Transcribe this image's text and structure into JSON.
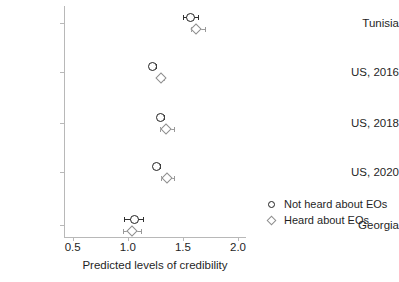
{
  "chart_data": {
    "type": "scatter",
    "title": "",
    "xlabel": "Predicted levels of credibility",
    "ylabel": "",
    "xlim": [
      0.5,
      2.0
    ],
    "xticks": [
      "0.5",
      "1.0",
      "1.5",
      "2.0"
    ],
    "xtick_values": [
      0.5,
      1.0,
      1.5,
      2.0
    ],
    "categories": [
      "Tunisia",
      "US, 2016",
      "US, 2018",
      "US, 2020",
      "Georgia"
    ],
    "grid": false,
    "legend_position": "lower right",
    "orientation": "horizontal-dotplot-with-error-bars",
    "series": [
      {
        "name": "Not heard about EOs",
        "marker": "circle",
        "color": "#202020",
        "values": [
          1.57,
          1.22,
          1.3,
          1.26,
          1.06
        ],
        "ci_low": [
          1.5,
          1.19,
          1.28,
          1.24,
          0.97
        ],
        "ci_high": [
          1.64,
          1.26,
          1.33,
          1.29,
          1.14
        ]
      },
      {
        "name": "Heard about EOs",
        "marker": "diamond",
        "color": "#8e8e8e",
        "values": [
          1.62,
          1.3,
          1.35,
          1.36,
          1.04
        ],
        "ci_low": [
          1.57,
          1.27,
          1.29,
          1.3,
          0.96
        ],
        "ci_high": [
          1.7,
          1.33,
          1.42,
          1.42,
          1.12
        ]
      }
    ]
  },
  "legend": {
    "entries": [
      {
        "label": "Not heard about EOs",
        "marker": "circle"
      },
      {
        "label": "Heard about EOs",
        "marker": "diamond"
      }
    ]
  },
  "axis": {
    "x_title": "Predicted levels of credibility"
  }
}
